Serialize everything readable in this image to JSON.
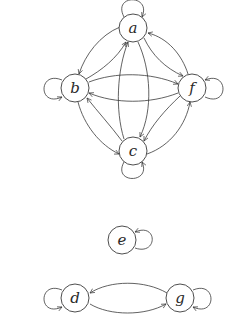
{
  "diagram": {
    "type": "directed-graph",
    "stroke_color": "#3a3a3a",
    "nodes": [
      {
        "id": "a",
        "label": "a"
      },
      {
        "id": "b",
        "label": "b"
      },
      {
        "id": "f",
        "label": "f"
      },
      {
        "id": "c",
        "label": "c"
      },
      {
        "id": "e",
        "label": "e"
      },
      {
        "id": "d",
        "label": "d"
      },
      {
        "id": "g",
        "label": "g"
      }
    ],
    "edges": [
      {
        "from": "a",
        "to": "a",
        "kind": "self-loop"
      },
      {
        "from": "b",
        "to": "b",
        "kind": "self-loop"
      },
      {
        "from": "f",
        "to": "f",
        "kind": "self-loop"
      },
      {
        "from": "c",
        "to": "c",
        "kind": "self-loop"
      },
      {
        "from": "e",
        "to": "e",
        "kind": "self-loop"
      },
      {
        "from": "d",
        "to": "d",
        "kind": "self-loop"
      },
      {
        "from": "g",
        "to": "g",
        "kind": "self-loop"
      },
      {
        "from": "a",
        "to": "b"
      },
      {
        "from": "b",
        "to": "a"
      },
      {
        "from": "a",
        "to": "f"
      },
      {
        "from": "f",
        "to": "a"
      },
      {
        "from": "a",
        "to": "c"
      },
      {
        "from": "c",
        "to": "a"
      },
      {
        "from": "b",
        "to": "f"
      },
      {
        "from": "f",
        "to": "b"
      },
      {
        "from": "b",
        "to": "c"
      },
      {
        "from": "c",
        "to": "b"
      },
      {
        "from": "f",
        "to": "c"
      },
      {
        "from": "c",
        "to": "f"
      },
      {
        "from": "d",
        "to": "g"
      },
      {
        "from": "g",
        "to": "d"
      }
    ]
  }
}
